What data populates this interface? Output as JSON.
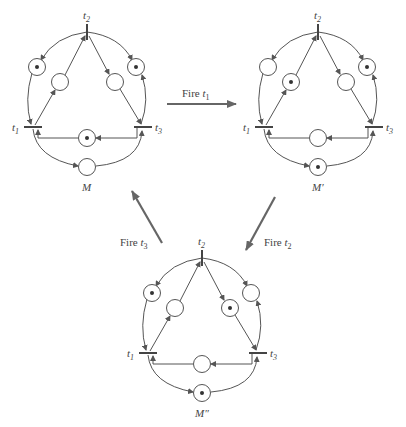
{
  "diagram": {
    "type": "petri-net-firing-sequence",
    "nets": [
      {
        "id": "M",
        "label": "M",
        "transitions": {
          "t1": "t1",
          "t2": "t2",
          "t3": "t3"
        },
        "places": {
          "outer_left": 1,
          "inner_left": 0,
          "inner_right": 0,
          "outer_right": 1,
          "middle": 1,
          "bottom": 0
        }
      },
      {
        "id": "M_prime",
        "label": "M′",
        "transitions": {
          "t1": "t1",
          "t2": "t2",
          "t3": "t3"
        },
        "places": {
          "outer_left": 0,
          "inner_left": 1,
          "inner_right": 0,
          "outer_right": 1,
          "middle": 0,
          "bottom": 1
        }
      },
      {
        "id": "M_double_prime",
        "label": "M″",
        "transitions": {
          "t1": "t1",
          "t2": "t2",
          "t3": "t3"
        },
        "places": {
          "outer_left": 1,
          "inner_left": 0,
          "inner_right": 1,
          "outer_right": 0,
          "middle": 0,
          "bottom": 1
        }
      }
    ],
    "firings": [
      {
        "from": "M",
        "to": "M_prime",
        "label_prefix": "Fire ",
        "label_t": "t",
        "label_sub": "1"
      },
      {
        "from": "M_prime",
        "to": "M_double_prime",
        "label_prefix": "Fire ",
        "label_t": "t",
        "label_sub": "2"
      },
      {
        "from": "M_double_prime",
        "to": "M",
        "label_prefix": "Fire ",
        "label_t": "t",
        "label_sub": "3"
      }
    ],
    "colors": {
      "line": "#555555",
      "token": "#333333",
      "arrow": "#666666",
      "background": "#ffffff"
    }
  }
}
